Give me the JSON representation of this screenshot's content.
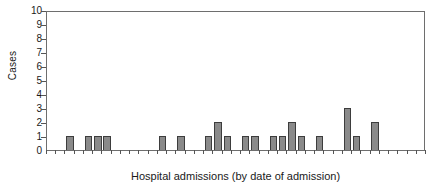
{
  "chart_data": {
    "type": "bar",
    "title": "",
    "subtitle": "",
    "xlabel": "Hospital admissions (by date of admission)",
    "ylabel": "Cases",
    "ylim": [
      0,
      10
    ],
    "yticks": [
      0,
      1,
      2,
      3,
      4,
      5,
      6,
      7,
      8,
      9,
      10
    ],
    "ytick_labels": [
      "0",
      "1",
      "2",
      "3",
      "4",
      "5",
      "6",
      "7",
      "8",
      "9",
      "10"
    ],
    "grid": false,
    "legend": null,
    "bar_color": "#8a8a8a",
    "bar_edge_color": "#3d3d3d",
    "axis_color": "#6e6e6e",
    "n_slots": 41,
    "categories": [
      "1",
      "2",
      "3",
      "4",
      "5",
      "6",
      "7",
      "8",
      "9",
      "10",
      "11",
      "12",
      "13",
      "14",
      "15",
      "16",
      "17",
      "18",
      "19",
      "20",
      "21",
      "22",
      "23",
      "24",
      "25",
      "26",
      "27",
      "28",
      "29",
      "30",
      "31",
      "32",
      "33",
      "34",
      "35",
      "36",
      "37",
      "38",
      "39",
      "40",
      "41"
    ],
    "values": [
      0,
      0,
      1,
      0,
      1,
      1,
      1,
      0,
      0,
      0,
      0,
      0,
      1,
      0,
      1,
      0,
      0,
      1,
      2,
      1,
      0,
      1,
      1,
      0,
      1,
      1,
      2,
      1,
      0,
      1,
      0,
      0,
      3,
      1,
      0,
      2,
      0,
      0,
      0,
      0,
      0
    ]
  },
  "annotations": {
    "axis_note": ""
  }
}
